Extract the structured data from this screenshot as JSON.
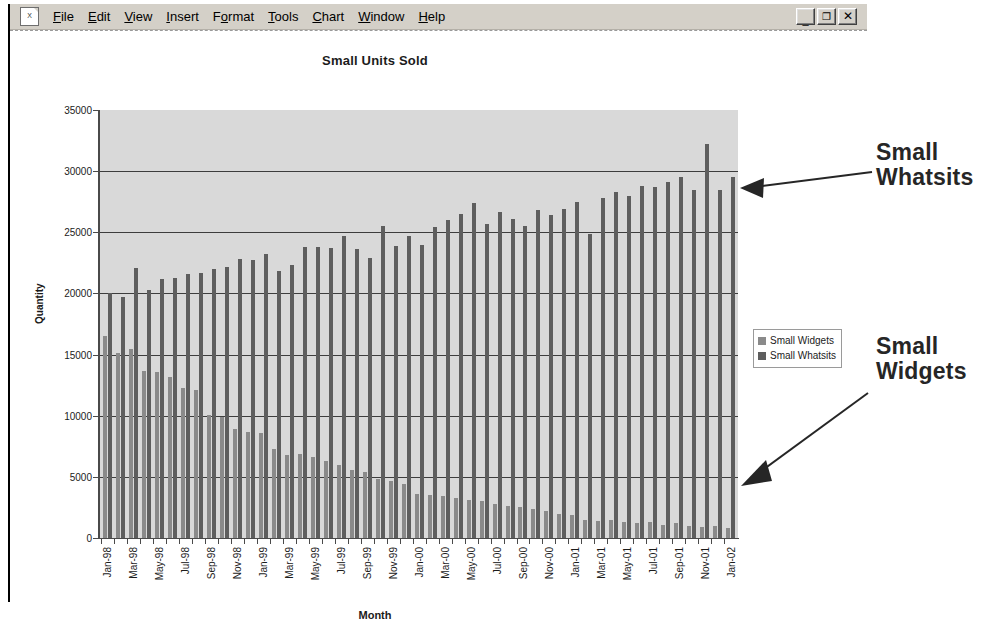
{
  "window": {
    "doc_icon": "excel-chart-icon",
    "menu_items": [
      {
        "label": "File",
        "accel": "F"
      },
      {
        "label": "Edit",
        "accel": "E"
      },
      {
        "label": "View",
        "accel": "V"
      },
      {
        "label": "Insert",
        "accel": "I"
      },
      {
        "label": "Format",
        "accel": "o"
      },
      {
        "label": "Tools",
        "accel": "T"
      },
      {
        "label": "Chart",
        "accel": "C"
      },
      {
        "label": "Window",
        "accel": "W"
      },
      {
        "label": "Help",
        "accel": "H"
      }
    ],
    "buttons": {
      "minimize": "_",
      "restore": "❐",
      "close": "✕"
    }
  },
  "annotations": [
    {
      "id": "whatsits",
      "line1": "Small",
      "line2": "Whatsits"
    },
    {
      "id": "widgets",
      "line1": "Small",
      "line2": "Widgets"
    }
  ],
  "chart_data": {
    "type": "bar",
    "title": "Small Units Sold",
    "xlabel": "Month",
    "ylabel": "Quantity",
    "ylim": [
      0,
      35000
    ],
    "ytick_step": 5000,
    "yticks": [
      0,
      5000,
      10000,
      15000,
      20000,
      25000,
      30000,
      35000
    ],
    "ytick_labels": [
      "0",
      "5000",
      "10000",
      "15000",
      "20000",
      "25000",
      "30000",
      "35000"
    ],
    "grid": true,
    "grid_axis": "y",
    "legend_position": "right",
    "label_interval": 2,
    "categories": [
      "Jan-98",
      "Feb-98",
      "Mar-98",
      "Apr-98",
      "May-98",
      "Jun-98",
      "Jul-98",
      "Aug-98",
      "Sep-98",
      "Oct-98",
      "Nov-98",
      "Dec-98",
      "Jan-99",
      "Feb-99",
      "Mar-99",
      "Apr-99",
      "May-99",
      "Jun-99",
      "Jul-99",
      "Aug-99",
      "Sep-99",
      "Oct-99",
      "Nov-99",
      "Dec-99",
      "Jan-00",
      "Feb-00",
      "Mar-00",
      "Apr-00",
      "May-00",
      "Jun-00",
      "Jul-00",
      "Aug-00",
      "Sep-00",
      "Oct-00",
      "Nov-00",
      "Dec-00",
      "Jan-01",
      "Feb-01",
      "Mar-01",
      "Apr-01",
      "May-01",
      "Jun-01",
      "Jul-01",
      "Aug-01",
      "Sep-01",
      "Oct-01",
      "Nov-01",
      "Dec-01",
      "Jan-02"
    ],
    "tick_labels": [
      "Jan-98",
      "",
      "Mar-98",
      "",
      "May-98",
      "",
      "Jul-98",
      "",
      "Sep-98",
      "",
      "Nov-98",
      "",
      "Jan-99",
      "",
      "Mar-99",
      "",
      "May-99",
      "",
      "Jul-99",
      "",
      "Sep-99",
      "",
      "Nov-99",
      "",
      "Jan-00",
      "",
      "Mar-00",
      "",
      "May-00",
      "",
      "Jul-00",
      "",
      "Sep-00",
      "",
      "Nov-00",
      "",
      "Jan-01",
      "",
      "Mar-01",
      "",
      "May-01",
      "",
      "Jul-01",
      "",
      "Sep-01",
      "",
      "Nov-01",
      "",
      "Jan-02"
    ],
    "series": [
      {
        "name": "Small Widgets",
        "color": "#8a8a8a",
        "values": [
          16500,
          15100,
          15500,
          13700,
          13600,
          13200,
          12300,
          12100,
          10100,
          9900,
          8900,
          8700,
          8600,
          7300,
          6800,
          6900,
          6600,
          6300,
          6000,
          5600,
          5400,
          4800,
          4700,
          4400,
          3600,
          3500,
          3400,
          3300,
          3100,
          3000,
          2800,
          2600,
          2500,
          2400,
          2200,
          2000,
          1900,
          1500,
          1400,
          1500,
          1300,
          1200,
          1300,
          1100,
          1200,
          1000,
          900,
          950,
          800
        ]
      },
      {
        "name": "Small Whatsits",
        "color": "#5e5e5e",
        "values": [
          20000,
          19700,
          22100,
          20300,
          21200,
          21300,
          21600,
          21700,
          22000,
          22200,
          22800,
          22700,
          23200,
          21800,
          22300,
          23800,
          23800,
          23700,
          24700,
          23600,
          22900,
          25500,
          23900,
          24700,
          24000,
          25400,
          26000,
          26500,
          27400,
          25700,
          26700,
          26100,
          25500,
          26800,
          26400,
          26900,
          27500,
          24900,
          27800,
          28300,
          28000,
          28800,
          28700,
          29100,
          29500,
          28500,
          32200,
          28500,
          29500
        ]
      }
    ]
  }
}
